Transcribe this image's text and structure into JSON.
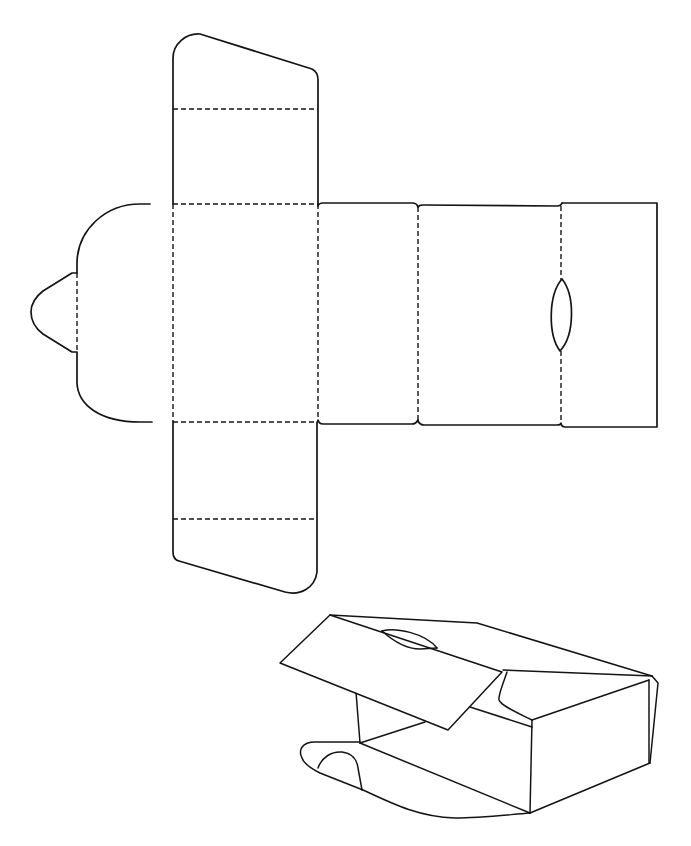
{
  "colors": {
    "background": "#ffffff",
    "line": "#141414"
  },
  "net": {
    "top_flap": {
      "outline": "M173,204 L173,58 C173,44 186,33 200,34 L312,69 C316,71 318,74 318,80 L318,204",
      "fold": "M173,109 L318,109"
    },
    "left_round_flap": {
      "outline": "M150,204 L140,204 C105,204 78,230 77,262 L77,273 L72,273 L43,291 C34,298 31,305 31,312 C31,320 35,328 43,334 L72,352 L77,352 L77,383 C78,405 100,422 140,422 L152,422",
      "tab_fold": "M77,273 L77,352"
    },
    "front_panel": {
      "fold_top": "M173,204 L318,204",
      "fold_bottom": "M173,422 L318,422",
      "fold_left": "M173,204 L173,422",
      "fold_right": "M318,204 L318,422"
    },
    "bottom_flap": {
      "outline": "M173,422 L173,552 C173,557 175,560 179,561 L285,592 C300,596 315,588 317,572 L317,422",
      "fold": "M173,519 L317,519"
    },
    "side_panel_1": {
      "outline": "M318,206 Q319,203 323,203 L412,203 Q417,203 418,207 M318,420 Q319,424 323,424 L412,424 Q416,424 418,420",
      "fold_right": "M418,207 L418,421"
    },
    "back_panel": {
      "outline": "M418,207 Q419,205 423,205 L557,206 Q561,206 562,203 M418,421 Q420,425 424,425 L557,425 Q561,425 561,423",
      "fold_right_upper": "M561,206 L561,280",
      "fold_right_lower": "M561,351 L561,424"
    },
    "tuck_panel": {
      "outline": "M562,203 L657,203 L657,427 L565,427 Q562,427 561,424"
    },
    "thumb_notch": {
      "outline": "M562,279 C575,295 575,335 560,351 C548,335 548,295 562,279 Z"
    }
  },
  "assembled_box": {
    "lid": "M330,615 L502,672 L448,730 L280,663 Z",
    "lid_notch_upper": "M382,631 C395,627 425,633 437,648",
    "lid_notch_lower": "M382,631 C392,640 405,649 420,649 L437,648",
    "back_top_edge": "M330,615 L477,623 L652,676",
    "inner_top_edge": "M503,670 L652,676",
    "right_side_outer": "M652,676 L658,683 L650,763",
    "right_side_inner": "M649,680 L649,763",
    "right_face_top": "M532,720 L649,680",
    "right_face_bottom": "M530,813 L650,763",
    "tuck_curve": "M507,672 C503,684 498,695 499,700 C501,706 520,714 532,720",
    "front_top_edge": "M470,707 L532,727",
    "front_corner": "M532,720 L530,813",
    "back_inner_vertical": "M356,692 L360,743",
    "inner_floor_line": "M360,743 L425,722",
    "bottom_diagonal": "M360,743 L530,813",
    "bottom_flap": "M360,742 L315,742 C302,742 298,750 302,758 C304,764 310,768 320,773 L363,790 C395,805 420,817 455,818 C480,818 505,815 530,813",
    "bottom_flap_tab": "M318,768 C322,757 332,751 342,752 C352,753 357,760 358,768 L362,790"
  }
}
